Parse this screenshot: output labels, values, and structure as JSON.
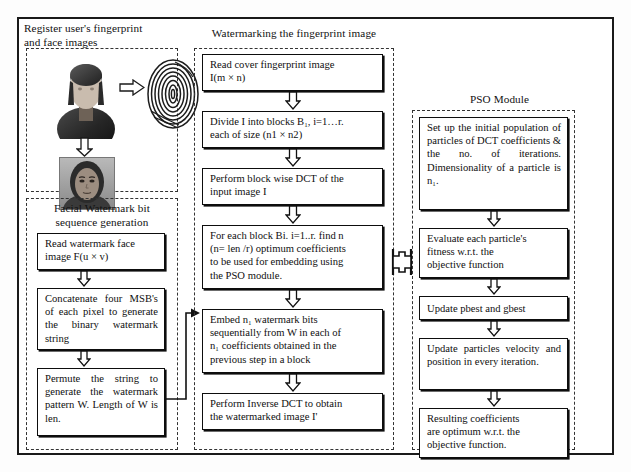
{
  "diagram": {
    "groups": {
      "register": {
        "caption": "Register user's fingerprint\nand face images"
      },
      "watermarking": {
        "caption": "Watermarking the fingerprint image"
      },
      "facial": {
        "caption": "Facial Watermark bit\nsequence generation"
      },
      "pso": {
        "caption": "PSO Module"
      }
    },
    "biometrics": {
      "person_label": "person-photo",
      "fingerprint_label": "fingerprint-image",
      "face_label": "face-photo"
    },
    "facial_steps": [
      {
        "id": "read-watermark-face",
        "text": "Read watermark face\nimage F(u × v)"
      },
      {
        "id": "concatenate-msb",
        "text": "Concatenate four MSB's of each pixel to generate the binary watermark string"
      },
      {
        "id": "permute-string",
        "text": "Permute the string to generate the watermark pattern W. Length of W is len."
      }
    ],
    "watermarking_steps": [
      {
        "id": "read-cover-fingerprint",
        "text": "Read cover fingerprint image\nI(m × n)"
      },
      {
        "id": "divide-blocks",
        "text": "Divide I into blocks B₁, i=1…r.\neach of size (n1 × n2)"
      },
      {
        "id": "block-wise-dct",
        "text": "Perform block wise DCT of the\ninput image I"
      },
      {
        "id": "find-optimum-coefficients",
        "text": "For each block Bi. i=1..r. find n\n(n= len /r) optimum coefficients\nto be used for embedding using\nthe PSO module."
      },
      {
        "id": "embed-watermark-bits",
        "text": "Embed n₁ watermark bits\nsequentially from W in each of\nn₁ coefficients obtained in the\nprevious step in a block"
      },
      {
        "id": "inverse-dct",
        "text": "Perform Inverse DCT to obtain\nthe watermarked image I'"
      }
    ],
    "pso_steps": [
      {
        "id": "setup-population",
        "text": "Set up the initial population of particles of DCT coefficients & the no. of iterations. Dimensionality of a particle is n₁."
      },
      {
        "id": "evaluate-fitness",
        "text": "Evaluate each particle's\nfitness w.r.t. the\nobjective function"
      },
      {
        "id": "update-pbest-gbest",
        "text": "Update pbest and gbest"
      },
      {
        "id": "update-velocity-position",
        "text": "Update particles velocity and position in every iteration."
      },
      {
        "id": "resulting-coefficients",
        "text": "Resulting coefficients\nare optimum w.r.t. the\nobjective function."
      }
    ],
    "colors": {
      "ink": "#0d0d0d",
      "frame": "#1a1a1a",
      "dashed": "#333333",
      "paper": "#ffffff"
    }
  }
}
